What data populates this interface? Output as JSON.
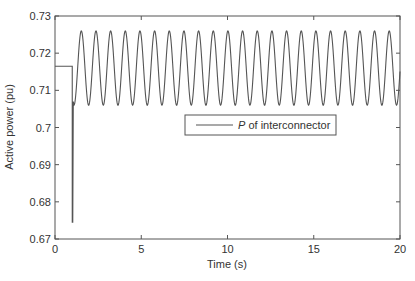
{
  "chart_data": {
    "type": "line",
    "title": "",
    "xlabel": "Time (s)",
    "ylabel": "Active power (pu)",
    "xlim": [
      0,
      20
    ],
    "ylim": [
      0.67,
      0.73
    ],
    "xticks": [
      0,
      5,
      10,
      15,
      20
    ],
    "xtick_labels": [
      "0",
      "5",
      "10",
      "15",
      "20"
    ],
    "yticks": [
      0.67,
      0.68,
      0.69,
      0.7,
      0.71,
      0.72,
      0.73
    ],
    "ytick_labels": [
      "0.67",
      "0.68",
      "0.69",
      "0.7",
      "0.71",
      "0.72",
      "0.73"
    ],
    "grid": false,
    "legend": {
      "position": "center-right",
      "entries": [
        {
          "italic": "P",
          "text": " of interconnector"
        }
      ]
    },
    "series": [
      {
        "name": "P of interconnector",
        "color": "#555555",
        "description": "Steady at ~0.7165 pu from 0 to 1 s, sharp drop to ~0.6745 pu at t≈1 s, then sustained oscillation between ~0.706 and ~0.726 pu with period ~0.85 s up to 20 s",
        "initial_value": 0.7165,
        "disturbance_time": 1.0,
        "disturbance_min": 0.6745,
        "oscillation": {
          "min": 0.706,
          "max": 0.726,
          "period": 0.85,
          "start": 1.1,
          "end": 20
        }
      }
    ]
  }
}
